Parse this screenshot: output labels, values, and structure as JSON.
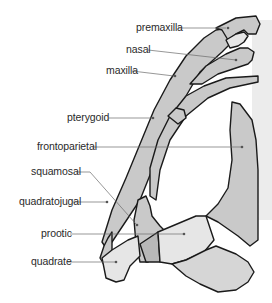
{
  "diagram": {
    "type": "anatomical-skull-diagram",
    "colors": {
      "bone_dark": "#c9c9c9",
      "bone_light": "#e6e6e6",
      "bone_mid": "#d6d6d6",
      "outline": "#1a1a1a",
      "leader": "#6a6a6a",
      "background_shade": "#ececec"
    },
    "labels": [
      {
        "id": "premaxilla",
        "text": "premaxilla"
      },
      {
        "id": "nasal",
        "text": "nasal"
      },
      {
        "id": "maxilla",
        "text": "maxilla"
      },
      {
        "id": "pterygoid",
        "text": "pterygoid"
      },
      {
        "id": "frontoparietal",
        "text": "frontoparietal"
      },
      {
        "id": "squamosal",
        "text": "squamosal"
      },
      {
        "id": "quadratojugal",
        "text": "quadratojugal"
      },
      {
        "id": "prootic",
        "text": "prootic"
      },
      {
        "id": "quadrate",
        "text": "quadrate"
      }
    ]
  }
}
